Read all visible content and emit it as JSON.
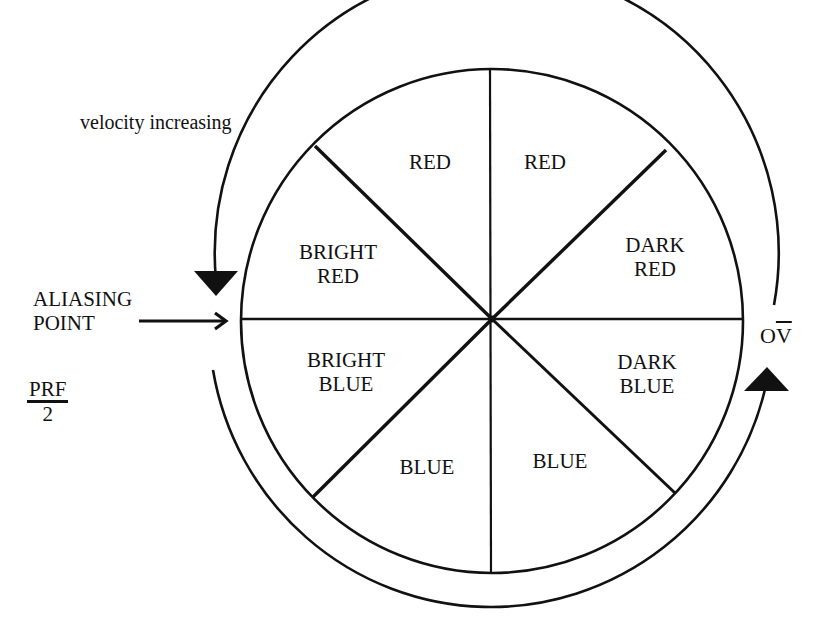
{
  "diagram": {
    "annotations": {
      "velocity_increasing": "velocity increasing",
      "aliasing_point_line1": "ALIASING",
      "aliasing_point_line2": "POINT",
      "prf_numerator": "PRF",
      "prf_denominator": "2",
      "ov_prefix": "O",
      "ov_overbar": "V"
    },
    "sectors": [
      {
        "position": "top-left",
        "line1": "RED",
        "line2": ""
      },
      {
        "position": "top-right",
        "line1": "RED",
        "line2": ""
      },
      {
        "position": "right-upper",
        "line1": "DARK",
        "line2": "RED"
      },
      {
        "position": "right-lower",
        "line1": "DARK",
        "line2": "BLUE"
      },
      {
        "position": "bottom-right",
        "line1": "BLUE",
        "line2": ""
      },
      {
        "position": "bottom-left",
        "line1": "BLUE",
        "line2": ""
      },
      {
        "position": "left-lower",
        "line1": "BRIGHT",
        "line2": "BLUE"
      },
      {
        "position": "left-upper",
        "line1": "BRIGHT",
        "line2": "RED"
      }
    ],
    "colors": {
      "stroke": "#111111",
      "background": "#ffffff"
    }
  }
}
